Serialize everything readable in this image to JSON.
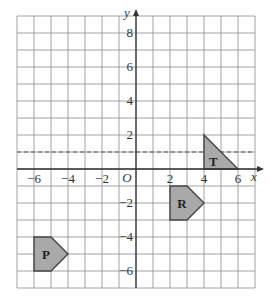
{
  "diagram": {
    "type": "coordinate-grid-transformations",
    "axes": {
      "x_label": "x",
      "y_label": "y",
      "origin_label": "O",
      "x_range": [
        -7,
        7
      ],
      "y_range": [
        -7,
        9
      ],
      "x_ticks": [
        {
          "value": -6,
          "label": "−6"
        },
        {
          "value": -4,
          "label": "−4"
        },
        {
          "value": -2,
          "label": "−2"
        },
        {
          "value": 2,
          "label": "2"
        },
        {
          "value": 4,
          "label": "4"
        },
        {
          "value": 6,
          "label": "6"
        }
      ],
      "y_ticks": [
        {
          "value": 8,
          "label": "8"
        },
        {
          "value": 6,
          "label": "6"
        },
        {
          "value": 4,
          "label": "4"
        },
        {
          "value": 2,
          "label": "2"
        },
        {
          "value": -2,
          "label": "−2"
        },
        {
          "value": -4,
          "label": "−4"
        },
        {
          "value": -6,
          "label": "−6"
        }
      ]
    },
    "dashed_line": {
      "equation": "y = 1",
      "y": 1
    },
    "shapes": [
      {
        "label": "T",
        "vertices": [
          [
            4,
            0
          ],
          [
            4,
            2
          ],
          [
            6,
            0
          ]
        ],
        "label_pos": [
          4.55,
          0.5
        ]
      },
      {
        "label": "R",
        "vertices": [
          [
            2,
            -1
          ],
          [
            3,
            -1
          ],
          [
            4,
            -2
          ],
          [
            3,
            -3
          ],
          [
            2,
            -3
          ]
        ],
        "label_pos": [
          2.7,
          -2
        ]
      },
      {
        "label": "P",
        "vertices": [
          [
            -6,
            -4
          ],
          [
            -5,
            -4
          ],
          [
            -4,
            -5
          ],
          [
            -5,
            -6
          ],
          [
            -6,
            -6
          ]
        ],
        "label_pos": [
          -5.3,
          -5
        ]
      }
    ],
    "colors": {
      "grid": "#8a8a8a",
      "axis": "#333333",
      "shape_fill": "#a9a9a9",
      "shape_stroke": "#444444",
      "dashed": "#555555"
    }
  }
}
